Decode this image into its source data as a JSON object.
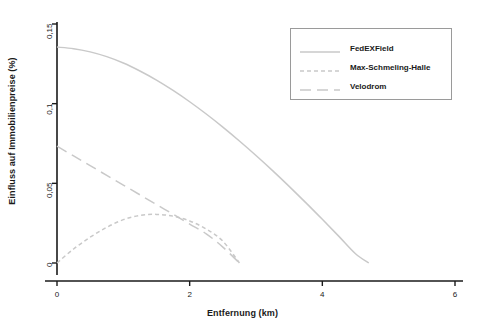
{
  "chart_data": {
    "type": "line",
    "title": "",
    "xlabel": "Entfernung (km)",
    "ylabel": "Einfluss auf Immobilienpreise (%)",
    "xlim": [
      0,
      6
    ],
    "ylim": [
      0,
      0.15
    ],
    "xticks": [
      0,
      2,
      4,
      6
    ],
    "xtick_labels": [
      "0",
      "2",
      "4",
      "6"
    ],
    "yticks": [
      0,
      0.05,
      0.1,
      0.15
    ],
    "ytick_labels": [
      "0",
      "0,05",
      "0,1",
      "0,15"
    ],
    "grid": false,
    "legend_position": "top-right",
    "line_color": "#c9c9c9",
    "axis_color": "#1a1a1a",
    "series": [
      {
        "name": "FedEXField",
        "style": "solid",
        "x": [
          0,
          0.25,
          0.5,
          0.75,
          1,
          1.25,
          1.5,
          1.75,
          2,
          2.25,
          2.5,
          2.75,
          3,
          3.25,
          3.5,
          3.75,
          4,
          4.25,
          4.5,
          4.7
        ],
        "y": [
          0.1355,
          0.1345,
          0.1325,
          0.1295,
          0.1255,
          0.1205,
          0.1148,
          0.1083,
          0.1012,
          0.0935,
          0.0853,
          0.0766,
          0.0675,
          0.058,
          0.0481,
          0.0379,
          0.0274,
          0.0167,
          0.0058,
          0.0
        ]
      },
      {
        "name": "Max-Schmeling-Halle",
        "style": "dashed-short",
        "x": [
          0,
          0.25,
          0.5,
          0.75,
          1,
          1.25,
          1.5,
          1.75,
          2,
          2.25,
          2.5,
          2.75
        ],
        "y": [
          0.0,
          0.0088,
          0.0162,
          0.0224,
          0.0272,
          0.0299,
          0.0305,
          0.0294,
          0.0264,
          0.0213,
          0.0137,
          0.0
        ]
      },
      {
        "name": "Velodrom",
        "style": "dashed-long",
        "x": [
          0,
          0.25,
          0.5,
          0.75,
          1,
          1.25,
          1.5,
          1.75,
          2,
          2.25,
          2.5,
          2.75
        ],
        "y": [
          0.0733,
          0.0672,
          0.0611,
          0.055,
          0.0489,
          0.0428,
          0.0367,
          0.0306,
          0.0244,
          0.0183,
          0.01,
          0.0
        ]
      }
    ]
  },
  "legend": {
    "items": [
      {
        "label": "FedEXField",
        "style": "solid"
      },
      {
        "label": "Max-Schmeling-Halle",
        "style": "dashed-short"
      },
      {
        "label": "Velodrom",
        "style": "dashed-long"
      }
    ]
  }
}
